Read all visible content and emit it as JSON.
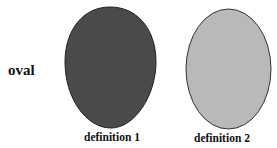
{
  "row_label": "oval",
  "shapes": [
    {
      "label": "definition 1",
      "fill": "#4a4a4a",
      "shape": "egg"
    },
    {
      "label": "definition 2",
      "fill": "#b9b9b9",
      "shape": "ellipse"
    }
  ],
  "stroke": "#222222"
}
